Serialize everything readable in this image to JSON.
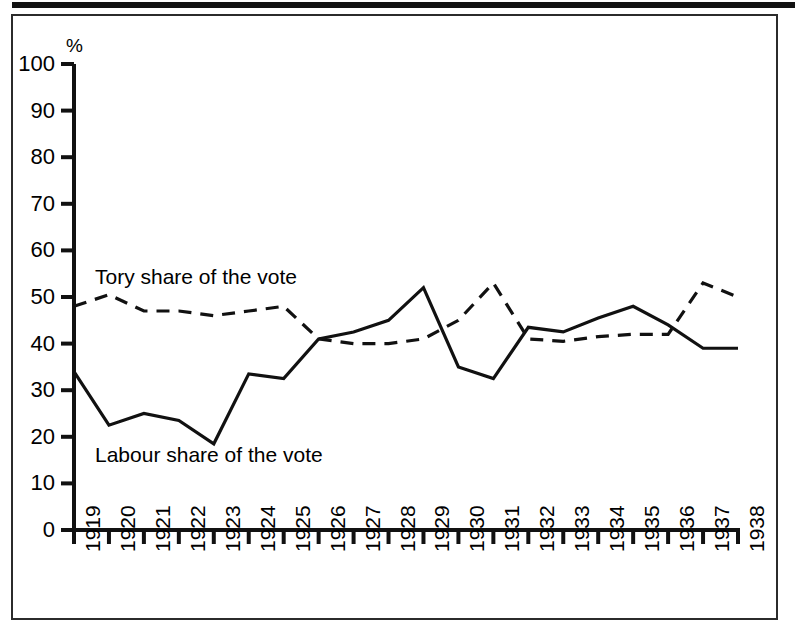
{
  "figure": {
    "axis_unit": "%",
    "frame_color": "#2b2b2b",
    "line_color": "#111111"
  },
  "chart_data": {
    "type": "line",
    "title": "",
    "xlabel": "",
    "ylabel": "%",
    "ylim": [
      0,
      100
    ],
    "ytick_values": [
      0,
      10,
      20,
      30,
      40,
      50,
      60,
      70,
      80,
      90,
      100
    ],
    "ytick_labels": [
      "0",
      "10",
      "20",
      "30",
      "40",
      "50",
      "60",
      "70",
      "80",
      "90",
      "100"
    ],
    "grid": false,
    "legend_position": "inline-annotation",
    "categories": [
      "1919",
      "1920",
      "1921",
      "1922",
      "1923",
      "1924",
      "1925",
      "1926",
      "1927",
      "1928",
      "1929",
      "1930",
      "1931",
      "1932",
      "1933",
      "1934",
      "1935",
      "1936",
      "1937",
      "1938"
    ],
    "x": [
      1919,
      1920,
      1921,
      1922,
      1923,
      1924,
      1925,
      1926,
      1927,
      1928,
      1929,
      1930,
      1931,
      1932,
      1933,
      1934,
      1935,
      1936,
      1937,
      1938
    ],
    "series": [
      {
        "name": "Tory share of the vote",
        "style": "dashed",
        "label": "Tory share of the vote",
        "values": [
          48,
          50.5,
          47,
          47,
          46,
          47,
          48,
          41,
          40,
          40,
          41,
          45,
          53,
          41,
          40.5,
          41.5,
          42,
          42,
          53,
          50
        ]
      },
      {
        "name": "Labour share of the vote",
        "style": "solid",
        "label": "Labour share of the vote",
        "values": [
          34,
          22.5,
          25,
          23.5,
          18.5,
          33.5,
          32.5,
          41,
          42.5,
          45,
          52,
          35,
          32.5,
          43.5,
          42.5,
          45.5,
          48,
          44,
          39,
          39
        ]
      }
    ]
  }
}
